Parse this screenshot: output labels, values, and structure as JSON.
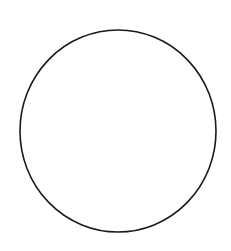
{
  "canvas": {
    "width": 231,
    "height": 251,
    "background": "#ffffff"
  },
  "shape": {
    "type": "circle",
    "cx": 118,
    "cy": 131,
    "rx": 98,
    "ry": 101,
    "stroke": "#1a1a1a",
    "stroke_width": 1.6,
    "fill": "none"
  }
}
